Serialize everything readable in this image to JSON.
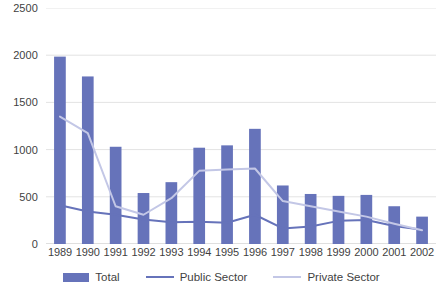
{
  "chart_data": {
    "type": "bar",
    "title": "",
    "xlabel": "",
    "ylabel": "",
    "ylim": [
      0,
      2500
    ],
    "ytick_step": 500,
    "yticks": [
      0,
      500,
      1000,
      1500,
      2000,
      2500
    ],
    "grid": true,
    "legend_position": "bottom",
    "categories": [
      "1989",
      "1990",
      "1991",
      "1992",
      "1993",
      "1994",
      "1995",
      "1996",
      "1997",
      "1998",
      "1999",
      "2000",
      "2001",
      "2002"
    ],
    "series": [
      {
        "name": "Total",
        "render": "bar",
        "color": "#6673ba",
        "values": [
          1985,
          1775,
          1030,
          540,
          655,
          1020,
          1045,
          1220,
          620,
          530,
          510,
          520,
          400,
          290
        ]
      },
      {
        "name": "Public Sector",
        "render": "line",
        "color": "#6673ba",
        "values": [
          410,
          345,
          310,
          260,
          230,
          235,
          225,
          310,
          165,
          185,
          245,
          255,
          190,
          150
        ]
      },
      {
        "name": "Private Sector",
        "render": "line",
        "color": "#c3c7e6",
        "values": [
          1350,
          1175,
          400,
          310,
          485,
          775,
          790,
          800,
          455,
          400,
          345,
          290,
          215,
          145
        ]
      }
    ]
  },
  "legend": {
    "items": [
      {
        "label": "Total",
        "marker": "bar-swatch",
        "color": "#6673ba"
      },
      {
        "label": "Public Sector",
        "marker": "line-swatch",
        "color": "#6673ba"
      },
      {
        "label": "Private Sector",
        "marker": "line-swatch-light",
        "color": "#c3c7e6"
      }
    ]
  },
  "axis": {
    "y_labels": [
      "2500",
      "2000",
      "1500",
      "1000",
      "500",
      "0"
    ],
    "x_labels": [
      "1989",
      "1990",
      "1991",
      "1992",
      "1993",
      "1994",
      "1995",
      "1996",
      "1997",
      "1998",
      "1999",
      "2000",
      "2001",
      "2002"
    ]
  }
}
